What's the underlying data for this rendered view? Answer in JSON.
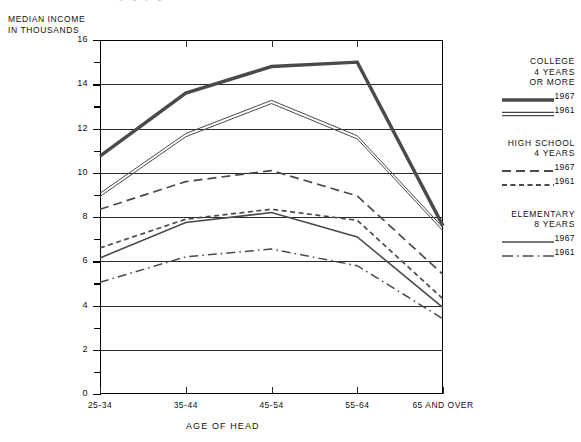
{
  "chart_data": {
    "type": "line",
    "title": "",
    "xlabel": "AGE OF HEAD",
    "ylabel": "MEDIAN INCOME\nIN THOUSANDS",
    "categories": [
      "25-34",
      "35-44",
      "45-54",
      "55-64",
      "65 AND OVER"
    ],
    "ylim": [
      0,
      16
    ],
    "yticks": [
      0,
      2,
      4,
      6,
      8,
      10,
      12,
      14,
      16
    ],
    "ytick_labels": [
      "0",
      "2",
      "4",
      "6",
      "8",
      "10",
      "12",
      "14",
      "16"
    ],
    "yminor_ticks": [
      1,
      3,
      5,
      7,
      9,
      11,
      13,
      15
    ],
    "grid": "horizontal",
    "legend_position": "right",
    "series": [
      {
        "name": "College 4 years or more, 1967",
        "group": "COLLEGE\n4 YEARS\nOR MORE",
        "year": "1967",
        "style": "thick-solid",
        "values": [
          10.75,
          13.6,
          14.8,
          15.0,
          7.6
        ]
      },
      {
        "name": "College 4 years or more, 1961",
        "group": "COLLEGE\n4 YEARS\nOR MORE",
        "year": "1961",
        "style": "double-line",
        "values": [
          9.0,
          11.7,
          13.2,
          11.6,
          7.45
        ]
      },
      {
        "name": "High school 4 years, 1967",
        "group": "HIGH SCHOOL\n4 YEARS",
        "year": "1967",
        "style": "long-dash",
        "values": [
          8.35,
          9.6,
          10.1,
          8.95,
          5.4
        ]
      },
      {
        "name": "High school 4 years, 1961",
        "group": "HIGH SCHOOL\n4 YEARS",
        "year": "1961",
        "style": "short-dash",
        "values": [
          6.6,
          7.9,
          8.35,
          7.85,
          4.3
        ]
      },
      {
        "name": "Elementary 8 years, 1967",
        "group": "ELEMENTARY\n8 YEARS",
        "year": "1967",
        "style": "thin-solid",
        "values": [
          6.15,
          7.75,
          8.2,
          7.1,
          3.9
        ]
      },
      {
        "name": "Elementary 8 years, 1961",
        "group": "ELEMENTARY\n8 YEARS",
        "year": "1961",
        "style": "dash-dot",
        "values": [
          5.05,
          6.2,
          6.55,
          5.8,
          3.4
        ]
      }
    ]
  },
  "legend": {
    "groups": [
      {
        "title": "COLLEGE\n4 YEARS\nOR MORE",
        "entries": [
          {
            "year": "1967",
            "style": "thick-solid"
          },
          {
            "year": "1961",
            "style": "double-line"
          }
        ]
      },
      {
        "title": "HIGH SCHOOL\n4 YEARS",
        "entries": [
          {
            "year": "1967",
            "style": "long-dash"
          },
          {
            "year": "1961",
            "style": "short-dash"
          }
        ]
      },
      {
        "title": "ELEMENTARY\n8 YEARS",
        "entries": [
          {
            "year": "1967",
            "style": "thin-solid"
          },
          {
            "year": "1961",
            "style": "dash-dot"
          }
        ]
      }
    ]
  },
  "colors": {
    "line": "#4a4a4a",
    "axis": "#000000",
    "grid": "#2a2a2a",
    "background": "#ffffff"
  }
}
